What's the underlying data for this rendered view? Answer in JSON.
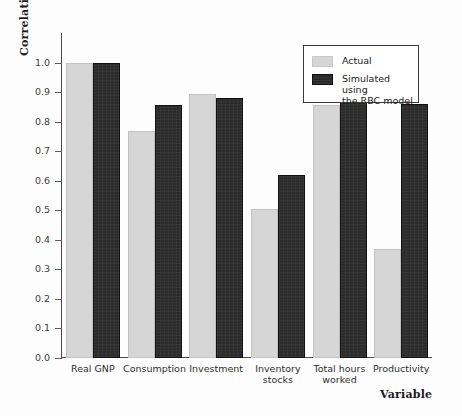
{
  "chart_data": {
    "type": "bar",
    "title": "",
    "xlabel": "Variable",
    "ylabel": "Correlation",
    "categories": [
      "Real GNP",
      "Consumption",
      "Investment",
      "Inventory\nstocks",
      "Total hours\nworked",
      "Productivity"
    ],
    "series": [
      {
        "name": "Actual",
        "color": "#d6d6d6",
        "values": [
          1.0,
          0.77,
          0.895,
          0.505,
          0.855,
          0.37
        ]
      },
      {
        "name": "Simulated using\nthe RBC model",
        "color": "#2b2b2b",
        "values": [
          1.0,
          0.855,
          0.88,
          0.62,
          0.95,
          0.86
        ]
      }
    ],
    "ylim": [
      0.0,
      1.1
    ],
    "yticks": [
      "0.0",
      "0.1",
      "0.2",
      "0.3",
      "0.4",
      "0.5",
      "0.6",
      "0.7",
      "0.8",
      "0.9",
      "1.0"
    ],
    "ytick_values": [
      0.0,
      0.1,
      0.2,
      0.3,
      0.4,
      0.5,
      0.6,
      0.7,
      0.8,
      0.9,
      1.0
    ],
    "grid": false,
    "legend_position": "top-right"
  },
  "legend": {
    "entries": [
      {
        "label": "Actual",
        "swatch": "light-gray"
      },
      {
        "label": "Simulated using\nthe RBC model",
        "swatch": "dark"
      }
    ]
  },
  "axes": {
    "y_title": "Correlation",
    "x_title": "Variable"
  }
}
